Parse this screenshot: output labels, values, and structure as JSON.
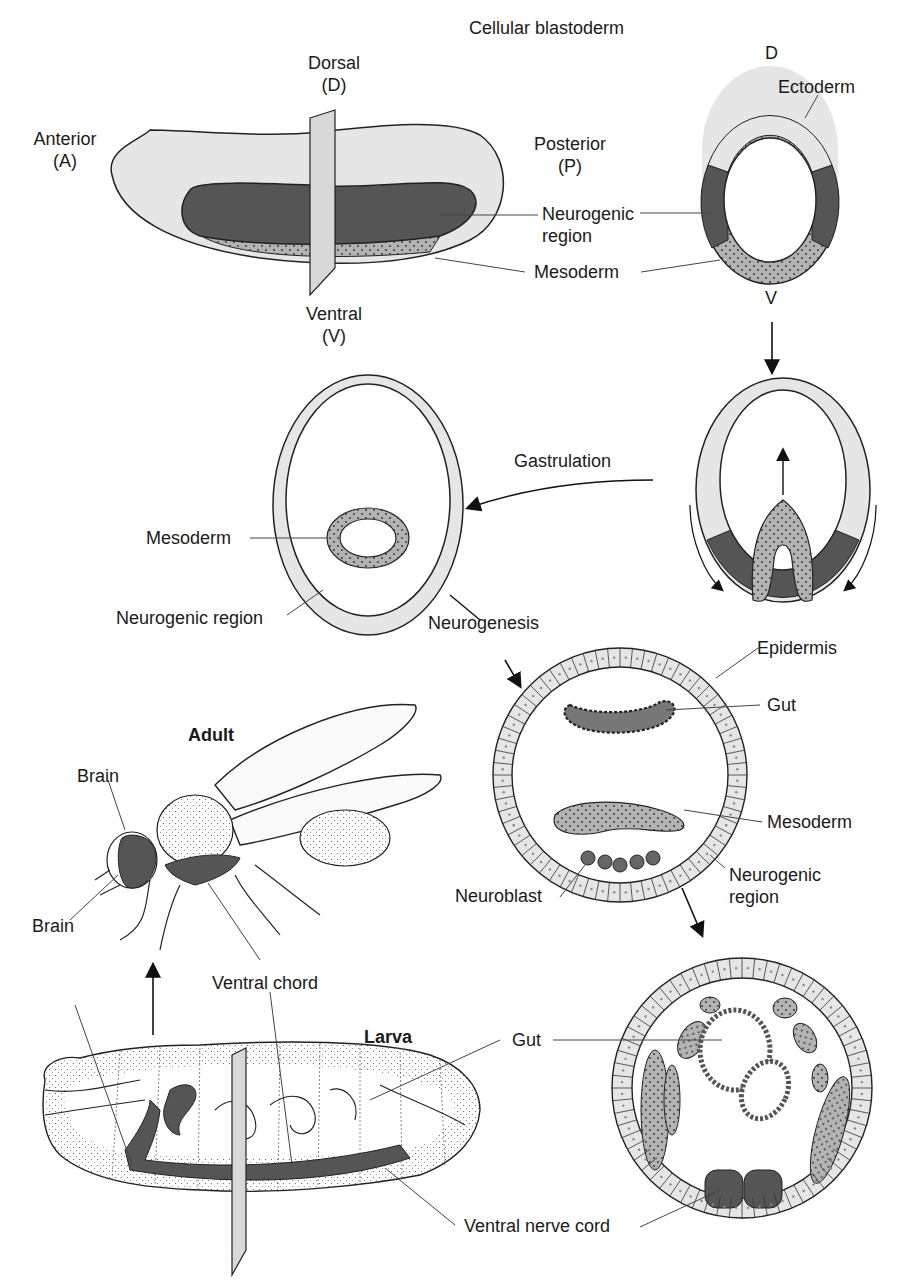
{
  "figure": {
    "title": "Cellular blastoderm",
    "colors": {
      "ectoderm": "#e6e6e6",
      "neurogenic": "#555555",
      "mesoderm": "#b3b3b3",
      "outline": "#222222",
      "plane": "#d8d8d8"
    },
    "blastoderm_side": {
      "dorsal": "Dorsal\n(D)",
      "ventral": "Ventral\n(V)",
      "anterior": "Anterior\n(A)",
      "posterior": "Posterior\n(P)",
      "neurogenic": "Neurogenic\nregion",
      "mesoderm": "Mesoderm"
    },
    "blastoderm_cross": {
      "dorsal": "D",
      "ventral": "V",
      "ectoderm": "Ectoderm"
    },
    "gastrulation": {
      "step": "Gastrulation",
      "mesoderm": "Mesoderm",
      "neurogenic": "Neurogenic region"
    },
    "neurogenesis": {
      "step": "Neurogenesis",
      "epidermis": "Epidermis",
      "gut": "Gut",
      "mesoderm": "Mesoderm",
      "neurogenic": "Neurogenic\nregion",
      "neuroblast": "Neuroblast"
    },
    "adult": {
      "title": "Adult",
      "brain_upper": "Brain",
      "brain_lower": "Brain",
      "ventral_chord": "Ventral chord"
    },
    "larva": {
      "title": "Larva",
      "gut": "Gut",
      "ventral_nerve_cord": "Ventral nerve cord"
    }
  }
}
